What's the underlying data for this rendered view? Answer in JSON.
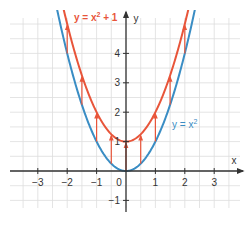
{
  "chart_data": {
    "type": "line",
    "title": "",
    "xlabel": "x",
    "ylabel": "y",
    "xlim": [
      -3.8,
      3.8
    ],
    "ylim": [
      -1.3,
      5.3
    ],
    "grid": true,
    "grid_step": 0.5,
    "x_ticks": [
      -3,
      -2,
      -1,
      0,
      1,
      2,
      3
    ],
    "x_tick_labels": [
      "−3",
      "−2",
      "−1",
      "0",
      "1",
      "2",
      "3"
    ],
    "y_ticks": [
      -1,
      1,
      2,
      3,
      4
    ],
    "y_tick_labels": [
      "−1",
      "1",
      "2",
      "3",
      "4"
    ],
    "series": [
      {
        "name": "y = x²",
        "label_main": "y = x",
        "label_sup": "2",
        "formula": "x^2",
        "color": "#3a8dc4",
        "x": [
          -2,
          -1.5,
          -1,
          -0.5,
          0,
          0.5,
          1,
          1.5,
          2
        ],
        "values": [
          4,
          2.25,
          1,
          0.25,
          0,
          0.25,
          1,
          2.25,
          4
        ]
      },
      {
        "name": "y = x² + 1",
        "label_main": "y = x",
        "label_sup": "2",
        "label_tail": " + 1",
        "formula": "x^2+1",
        "color": "#e8553a",
        "x": [
          -2,
          -1.5,
          -1,
          -0.5,
          0,
          0.5,
          1,
          1.5,
          2
        ],
        "values": [
          5,
          3.25,
          2,
          1.25,
          1,
          1.25,
          2,
          3.25,
          5
        ]
      }
    ],
    "annotations": {
      "shift_arrows": {
        "description": "Vertical shift of +1 from y = x² to y = x² + 1",
        "x": [
          -2,
          -1.5,
          -1,
          -0.5,
          0,
          0.5,
          1,
          1.5,
          2
        ],
        "shift": 1,
        "color": "#e8553a"
      }
    },
    "legend_position": "inline labels"
  },
  "colors": {
    "axis": "#333333",
    "grid": "#dddddd",
    "tick_label": "#333333"
  }
}
